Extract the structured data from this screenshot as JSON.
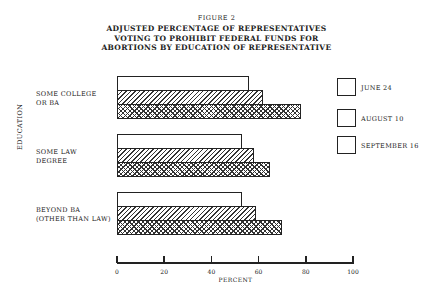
{
  "figure": {
    "number": "FIGURE 2",
    "title_lines": [
      "ADJUSTED PERCENTAGE OF REPRESENTATIVES",
      "VOTING TO PROHIBIT FEDERAL FUNDS FOR",
      "ABORTIONS BY EDUCATION OF REPRESENTATIVE"
    ]
  },
  "chart_data": {
    "type": "bar",
    "orientation": "horizontal",
    "title": "ADJUSTED PERCENTAGE OF REPRESENTATIVES VOTING TO PROHIBIT FEDERAL FUNDS FOR ABORTIONS BY EDUCATION OF REPRESENTATIVE",
    "subtitle": "FIGURE 2",
    "xlabel": "PERCENT",
    "ylabel": "EDUCATION",
    "xlim": [
      0,
      100
    ],
    "x_ticks": [
      "0",
      "20",
      "40",
      "60",
      "80",
      "100"
    ],
    "grid": false,
    "legend_position": "right",
    "categories": [
      "SOME COLLEGE\nOR BA",
      "SOME LAW\nDEGREE",
      "BEYOND BA\n(OTHER THAN LAW)"
    ],
    "series": [
      {
        "name": "JUNE 24",
        "pattern": "blank",
        "values": [
          56,
          53,
          53
        ]
      },
      {
        "name": "AUGUST 10",
        "pattern": "diagonal-hatch",
        "values": [
          62,
          58,
          59
        ]
      },
      {
        "name": "SEPTEMBER 16",
        "pattern": "cross-hatch",
        "values": [
          78,
          65,
          70
        ]
      }
    ]
  }
}
